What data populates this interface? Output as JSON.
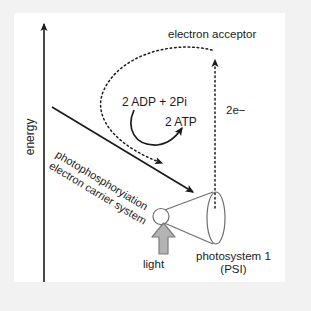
{
  "figure": {
    "type": "scientific-diagram",
    "background_color": "#f2f2f2",
    "panel_color": "#ffffff",
    "ink_color": "#1b1b1b",
    "light_arrow_color": "#a6a6a6"
  },
  "axis": {
    "label": "energy",
    "orientation": "vertical",
    "arrow_direction": "up"
  },
  "labels": {
    "electron_acceptor": "electron acceptor",
    "adp_pi": "2 ADP + 2Pi",
    "atp": "2 ATP",
    "two_electrons": "2e−",
    "pathway_line_1": "photophosphoryiation",
    "pathway_line_2": "electron carrier system",
    "light": "light",
    "photosystem_line_1": "photosystem 1",
    "photosystem_line_2": "(PSI)"
  },
  "elements": {
    "energy_axis": "vertical-arrow",
    "electron_transfer_line": "dotted-vertical-arrow-upward",
    "acceptor_return_path": "dotted-curved-arrow-looping-left",
    "carrier_chain_arrow": "solid-diagonal-arrow-downward-right",
    "atp_synthesis_arrow": "solid-curved-arrow",
    "photosystem_shape": "cone-funnel",
    "light_input": "thick-block-arrow-upward"
  }
}
